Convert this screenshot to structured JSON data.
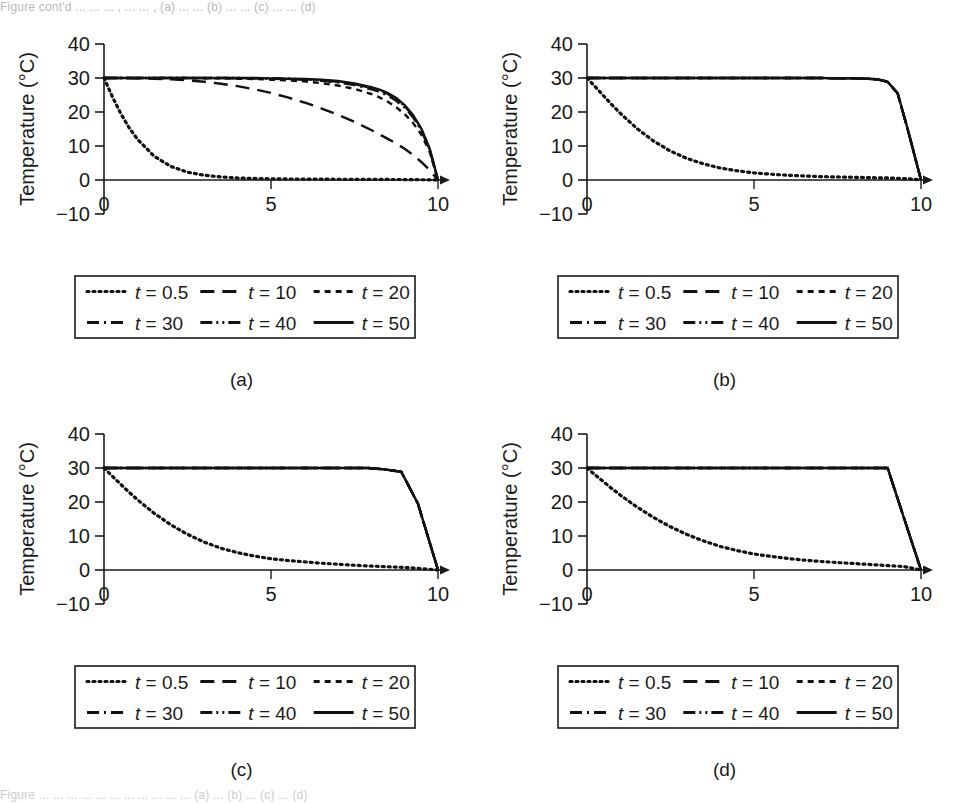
{
  "figure": {
    "top_caption": "Figure cont'd ...  ...  ... , ... ... , (a) ... ... (b) ... ... (c) ... ... (d)",
    "bottom_caption": "Figure    ...  ...  ...  ...  ...  ...  ...  ...  ...  ...  ...  (a) ... (b) ... (c) ... (d)",
    "panels": [
      "(a)",
      "(b)",
      "(c)",
      "(d)"
    ]
  },
  "axes": {
    "xlabel": "Distance (m)",
    "ylabel": "Temperature (°C)",
    "xticks": [
      "0",
      "5",
      "10"
    ],
    "xtickvalues": [
      0,
      5,
      10
    ],
    "yticks": [
      "40",
      "30",
      "20",
      "10",
      "0",
      "−10"
    ],
    "ytickvalues": [
      40,
      30,
      20,
      10,
      0,
      -10
    ],
    "xlim": [
      0,
      10
    ],
    "ylim": [
      -10,
      40
    ],
    "grid": false,
    "axis_color": "#1a1a1a"
  },
  "legend": {
    "position": "below-axes",
    "columns": 3,
    "rows": 2,
    "entries": [
      {
        "label": "t = 0.5",
        "var": "t",
        "value": 0.5,
        "style": "dotted",
        "dash": "2,4"
      },
      {
        "label": "t = 10",
        "var": "t",
        "value": 10,
        "style": "long-dash",
        "dash": "14,8"
      },
      {
        "label": "t = 20",
        "var": "t",
        "value": 20,
        "style": "dashed",
        "dash": "6,5"
      },
      {
        "label": "t = 30",
        "var": "t",
        "value": 30,
        "style": "dash-dot",
        "dash": "12,5,2,5"
      },
      {
        "label": "t = 40",
        "var": "t",
        "value": 40,
        "style": "dash-dot-dot",
        "dash": "12,4,2,4,2,4"
      },
      {
        "label": "t = 50",
        "var": "t",
        "value": 50,
        "style": "solid",
        "dash": "none"
      }
    ]
  },
  "chart_data": [
    {
      "id": "a",
      "type": "line",
      "title": "(a)",
      "xlabel": "Distance (m)",
      "ylabel": "Temperature (°C)",
      "xlim": [
        0,
        10
      ],
      "ylim": [
        -10,
        40
      ],
      "x": [
        0,
        0.25,
        0.5,
        0.75,
        1,
        1.5,
        2,
        2.5,
        3,
        3.5,
        4,
        4.5,
        5,
        5.5,
        6,
        6.5,
        7,
        7.5,
        8,
        8.25,
        8.5,
        8.75,
        9,
        9.25,
        9.5,
        9.75,
        10
      ],
      "series": [
        {
          "name": "t = 0.5",
          "style": "dotted",
          "values": [
            30,
            24.5,
            19.6,
            15.4,
            12,
            7.0,
            4.0,
            2.3,
            1.4,
            0.9,
            0.6,
            0.45,
            0.35,
            0.3,
            0.28,
            0.25,
            0.22,
            0.2,
            0.18,
            0.17,
            0.16,
            0.15,
            0.13,
            0.11,
            0.08,
            0.05,
            0
          ]
        },
        {
          "name": "t = 10",
          "style": "long-dash",
          "values": [
            30,
            30,
            30,
            30,
            29.9,
            29.8,
            29.6,
            29.3,
            28.9,
            28.3,
            27.6,
            26.7,
            25.6,
            24.3,
            22.8,
            21.1,
            19.2,
            17.1,
            14.7,
            13.4,
            12.1,
            10.7,
            9.2,
            7.4,
            5.3,
            2.9,
            0
          ]
        },
        {
          "name": "t = 20",
          "style": "dashed",
          "values": [
            30,
            30,
            30,
            30,
            30,
            30,
            30,
            30,
            29.9,
            29.9,
            29.8,
            29.7,
            29.5,
            29.3,
            29.0,
            28.5,
            27.8,
            26.8,
            25.3,
            24.3,
            23.0,
            21.4,
            19.4,
            16.8,
            13.4,
            8.3,
            0
          ]
        },
        {
          "name": "t = 30",
          "style": "dash-dot",
          "values": [
            30,
            30,
            30,
            30,
            30,
            30,
            30,
            30,
            30,
            30,
            29.9,
            29.9,
            29.8,
            29.7,
            29.5,
            29.2,
            28.7,
            27.9,
            26.7,
            25.9,
            24.8,
            23.3,
            21.3,
            18.5,
            14.6,
            9.0,
            0
          ]
        },
        {
          "name": "t = 40",
          "style": "dash-dot-dot",
          "values": [
            30,
            30,
            30,
            30,
            30,
            30,
            30,
            30,
            30,
            30,
            30,
            29.9,
            29.9,
            29.8,
            29.6,
            29.4,
            28.9,
            28.2,
            27.1,
            26.3,
            25.3,
            23.8,
            21.8,
            18.9,
            14.9,
            9.1,
            0
          ]
        },
        {
          "name": "t = 50",
          "style": "solid",
          "values": [
            30,
            30,
            30,
            30,
            30,
            30,
            30,
            30,
            30,
            30,
            30,
            30,
            29.9,
            29.8,
            29.7,
            29.5,
            29.1,
            28.4,
            27.3,
            26.6,
            25.6,
            24.1,
            22.0,
            19.1,
            15.1,
            9.2,
            0
          ]
        }
      ]
    },
    {
      "id": "b",
      "type": "line",
      "title": "(b)",
      "xlabel": "Distance (m)",
      "ylabel": "Temperature (°C)",
      "xlim": [
        0,
        10
      ],
      "ylim": [
        -10,
        40
      ],
      "x": [
        0,
        0.25,
        0.5,
        0.75,
        1,
        1.5,
        2,
        2.5,
        3,
        3.5,
        4,
        4.5,
        5,
        5.5,
        6,
        6.5,
        7,
        7.5,
        8,
        8.4,
        8.7,
        9,
        9.3,
        9.6,
        9.8,
        10
      ],
      "series": [
        {
          "name": "t = 0.5",
          "style": "dotted",
          "values": [
            30,
            27.4,
            24.7,
            22.1,
            19.6,
            15.1,
            11.4,
            8.5,
            6.3,
            4.7,
            3.5,
            2.7,
            2.1,
            1.7,
            1.4,
            1.2,
            1.0,
            0.9,
            0.8,
            0.7,
            0.65,
            0.6,
            0.5,
            0.35,
            0.2,
            0
          ]
        },
        {
          "name": "t = 10",
          "style": "long-dash",
          "values": [
            30,
            30,
            30,
            30,
            30,
            30,
            30,
            30,
            30,
            30,
            30,
            30,
            30,
            30,
            30,
            30,
            30,
            29.9,
            29.9,
            29.8,
            29.6,
            28.9,
            25.5,
            15.0,
            7.5,
            0
          ]
        },
        {
          "name": "t = 20",
          "style": "dashed",
          "values": [
            30,
            30,
            30,
            30,
            30,
            30,
            30,
            30,
            30,
            30,
            30,
            30,
            30,
            30,
            30,
            30,
            30,
            29.9,
            29.9,
            29.8,
            29.6,
            28.9,
            25.5,
            15.0,
            7.5,
            0
          ]
        },
        {
          "name": "t = 30",
          "style": "dash-dot",
          "values": [
            30,
            30,
            30,
            30,
            30,
            30,
            30,
            30,
            30,
            30,
            30,
            30,
            30,
            30,
            30,
            30,
            30,
            29.9,
            29.9,
            29.8,
            29.6,
            28.9,
            25.5,
            15.0,
            7.5,
            0
          ]
        },
        {
          "name": "t = 40",
          "style": "dash-dot-dot",
          "values": [
            30,
            30,
            30,
            30,
            30,
            30,
            30,
            30,
            30,
            30,
            30,
            30,
            30,
            30,
            30,
            30,
            30,
            29.9,
            29.9,
            29.8,
            29.6,
            28.9,
            25.5,
            15.0,
            7.5,
            0
          ]
        },
        {
          "name": "t = 50",
          "style": "solid",
          "values": [
            30,
            30,
            30,
            30,
            30,
            30,
            30,
            30,
            30,
            30,
            30,
            30,
            30,
            30,
            30,
            30,
            30,
            29.9,
            29.9,
            29.8,
            29.6,
            28.9,
            25.5,
            15.0,
            7.5,
            0
          ]
        }
      ]
    },
    {
      "id": "c",
      "type": "line",
      "title": "(c)",
      "xlabel": "Distance (m)",
      "ylabel": "Temperature (°C)",
      "xlim": [
        0,
        10
      ],
      "ylim": [
        -10,
        40
      ],
      "x": [
        0,
        0.25,
        0.5,
        0.75,
        1,
        1.5,
        2,
        2.5,
        3,
        3.5,
        4,
        4.5,
        5,
        5.5,
        6,
        6.5,
        7,
        7.5,
        7.9,
        8.4,
        8.9,
        9.4,
        10
      ],
      "series": [
        {
          "name": "t = 0.5",
          "style": "dotted",
          "values": [
            30,
            27.6,
            25.2,
            22.9,
            20.7,
            16.7,
            13.3,
            10.5,
            8.2,
            6.4,
            5.1,
            4.1,
            3.3,
            2.8,
            2.4,
            2.0,
            1.7,
            1.4,
            1.2,
            1.0,
            0.8,
            0.5,
            0
          ]
        },
        {
          "name": "t = 10",
          "style": "long-dash",
          "values": [
            30,
            30,
            30,
            30,
            30,
            30,
            30,
            30,
            30,
            30,
            30,
            30,
            30,
            30,
            30,
            30,
            30,
            30,
            30,
            29.6,
            28.9,
            19.5,
            0
          ]
        },
        {
          "name": "t = 20",
          "style": "dashed",
          "values": [
            30,
            30,
            30,
            30,
            30,
            30,
            30,
            30,
            30,
            30,
            30,
            30,
            30,
            30,
            30,
            30,
            30,
            30,
            30,
            29.6,
            28.9,
            19.5,
            0
          ]
        },
        {
          "name": "t = 30",
          "style": "dash-dot",
          "values": [
            30,
            30,
            30,
            30,
            30,
            30,
            30,
            30,
            30,
            30,
            30,
            30,
            30,
            30,
            30,
            30,
            30,
            30,
            30,
            29.6,
            28.9,
            19.5,
            0
          ]
        },
        {
          "name": "t = 40",
          "style": "dash-dot-dot",
          "values": [
            30,
            30,
            30,
            30,
            30,
            30,
            30,
            30,
            30,
            30,
            30,
            30,
            30,
            30,
            30,
            30,
            30,
            30,
            30,
            29.6,
            28.9,
            19.5,
            0
          ]
        },
        {
          "name": "t = 50",
          "style": "solid",
          "values": [
            30,
            30,
            30,
            30,
            30,
            30,
            30,
            30,
            30,
            30,
            30,
            30,
            30,
            30,
            30,
            30,
            30,
            30,
            30,
            29.6,
            28.9,
            19.5,
            0
          ]
        }
      ]
    },
    {
      "id": "d",
      "type": "line",
      "title": "(d)",
      "xlabel": "Distance (m)",
      "ylabel": "Temperature (°C)",
      "xlim": [
        0,
        10
      ],
      "ylim": [
        -10,
        40
      ],
      "x": [
        0,
        0.25,
        0.5,
        0.75,
        1,
        1.5,
        2,
        2.5,
        3,
        3.5,
        4,
        4.5,
        5,
        5.5,
        6,
        6.5,
        7,
        7.5,
        8,
        8.5,
        9,
        9.5,
        10
      ],
      "series": [
        {
          "name": "t = 0.5",
          "style": "dotted",
          "values": [
            30,
            27.9,
            25.9,
            23.9,
            22.0,
            18.5,
            15.4,
            12.7,
            10.4,
            8.5,
            6.9,
            5.7,
            4.7,
            4.0,
            3.4,
            2.9,
            2.5,
            2.2,
            1.9,
            1.6,
            1.3,
            1.0,
            0
          ]
        },
        {
          "name": "t = 10",
          "style": "long-dash",
          "values": [
            30,
            30,
            30,
            30,
            30,
            30,
            30,
            30,
            30,
            30,
            30,
            30,
            30,
            30,
            30,
            30,
            30,
            30,
            30,
            30,
            30,
            15.0,
            0
          ]
        },
        {
          "name": "t = 20",
          "style": "dashed",
          "values": [
            30,
            30,
            30,
            30,
            30,
            30,
            30,
            30,
            30,
            30,
            30,
            30,
            30,
            30,
            30,
            30,
            30,
            30,
            30,
            30,
            30,
            15.0,
            0
          ]
        },
        {
          "name": "t = 30",
          "style": "dash-dot",
          "values": [
            30,
            30,
            30,
            30,
            30,
            30,
            30,
            30,
            30,
            30,
            30,
            30,
            30,
            30,
            30,
            30,
            30,
            30,
            30,
            30,
            30,
            15.0,
            0
          ]
        },
        {
          "name": "t = 40",
          "style": "dash-dot-dot",
          "values": [
            30,
            30,
            30,
            30,
            30,
            30,
            30,
            30,
            30,
            30,
            30,
            30,
            30,
            30,
            30,
            30,
            30,
            30,
            30,
            30,
            30,
            15.0,
            0
          ]
        },
        {
          "name": "t = 50",
          "style": "solid",
          "values": [
            30,
            30,
            30,
            30,
            30,
            30,
            30,
            30,
            30,
            30,
            30,
            30,
            30,
            30,
            30,
            30,
            30,
            30,
            30,
            30,
            30,
            15.0,
            0
          ]
        }
      ]
    }
  ]
}
